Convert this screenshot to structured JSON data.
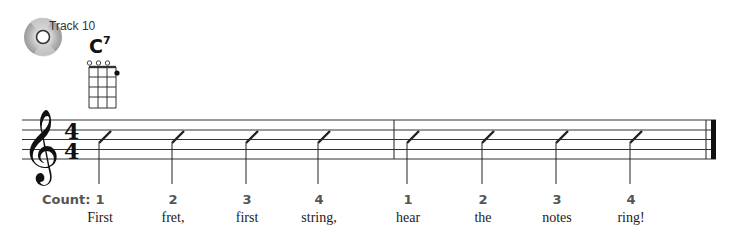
{
  "track": {
    "label": "Track 10",
    "icon": "cd-icon"
  },
  "chord": {
    "root": "C",
    "extension": "7",
    "diagram": {
      "strings": 4,
      "frets": 4,
      "open_strings": [
        1,
        2,
        3
      ],
      "fingered": [
        {
          "string": 4,
          "fret": 1
        }
      ]
    }
  },
  "staff": {
    "clef": "treble",
    "time_signature": {
      "top": "4",
      "bottom": "4"
    },
    "measures": 2,
    "final_barline": "end"
  },
  "count": {
    "label": "Count:",
    "beats": [
      {
        "num": "1",
        "lyric": "First",
        "x": 100
      },
      {
        "num": "2",
        "lyric": "fret,",
        "x": 173
      },
      {
        "num": "3",
        "lyric": "first",
        "x": 247
      },
      {
        "num": "4",
        "lyric": "string,",
        "x": 319
      },
      {
        "num": "1",
        "lyric": "hear",
        "x": 408
      },
      {
        "num": "2",
        "lyric": "the",
        "x": 483
      },
      {
        "num": "3",
        "lyric": "notes",
        "x": 557
      },
      {
        "num": "4",
        "lyric": "ring!",
        "x": 631
      }
    ]
  }
}
